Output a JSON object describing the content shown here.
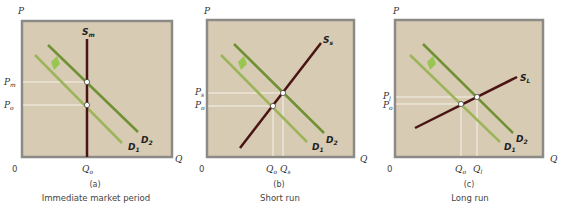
{
  "colors": {
    "panel_bg": "#d8cbb3",
    "panel_border": "#8c8a86",
    "demand_d1": "#9cb55a",
    "demand_d2": "#6f9134",
    "supply": "#4a1414",
    "guide": "#f5f1e8",
    "shift_arrow": "#8cc63f"
  },
  "panels": [
    {
      "id": "a",
      "panel_label": "(a)",
      "caption": "Immediate market period",
      "y_axis": "P",
      "x_axis": "Q",
      "origin": "0",
      "supply_label": "S",
      "supply_sub": "m",
      "d1_label": "D",
      "d1_sub": "1",
      "d2_label": "D",
      "d2_sub": "2",
      "p_high_label": "P",
      "p_high_sub": "m",
      "p_low_label": "P",
      "p_low_sub": "o",
      "q_low_label": "Q",
      "q_low_sub": "o"
    },
    {
      "id": "b",
      "panel_label": "(b)",
      "caption": "Short run",
      "y_axis": "P",
      "x_axis": "Q",
      "origin": "0",
      "supply_label": "S",
      "supply_sub": "s",
      "d1_label": "D",
      "d1_sub": "1",
      "d2_label": "D",
      "d2_sub": "2",
      "p_high_label": "P",
      "p_high_sub": "s",
      "p_low_label": "P",
      "p_low_sub": "o",
      "q_low_label": "Q",
      "q_low_sub": "o",
      "q_high_label": "Q",
      "q_high_sub": "s"
    },
    {
      "id": "c",
      "panel_label": "(c)",
      "caption": "Long run",
      "y_axis": "P",
      "x_axis": "Q",
      "origin": "0",
      "supply_label": "S",
      "supply_sub": "L",
      "d1_label": "D",
      "d1_sub": "1",
      "d2_label": "D",
      "d2_sub": "2",
      "p_high_label": "P",
      "p_high_sub": "l",
      "p_low_label": "P",
      "p_low_sub": "o",
      "q_low_label": "Q",
      "q_low_sub": "o",
      "q_high_label": "Q",
      "q_high_sub": "l"
    }
  ]
}
